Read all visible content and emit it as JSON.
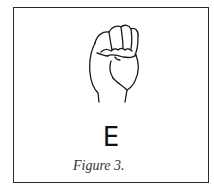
{
  "figure": {
    "letter": "E",
    "caption": "Figure 3.",
    "illustration": "asl-letter-e-hand-icon",
    "border_color": "#2a2a2a",
    "text_color": "#111111"
  }
}
